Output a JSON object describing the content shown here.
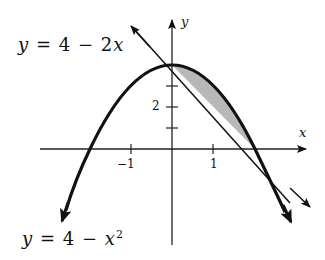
{
  "diagram": {
    "labels": {
      "line_eq": {
        "y": "y",
        "eq": "=",
        "a": "4",
        "op": "−",
        "b": "2",
        "var": "x"
      },
      "parabola_eq": {
        "y": "y",
        "eq": "=",
        "a": "4",
        "op": "−",
        "var": "x",
        "exp": "2"
      },
      "x_axis": "x",
      "y_axis": "y",
      "tick_neg1": "−1",
      "tick_1": "1",
      "tick_2": "2"
    },
    "curves": [
      {
        "name": "line",
        "equation": "y = 4 - 2x"
      },
      {
        "name": "parabola",
        "equation": "y = 4 - x^2"
      }
    ],
    "shaded_region": {
      "x_from": 0,
      "x_to": 2,
      "fill": "#b8b8b8"
    },
    "intersections": [
      [
        0,
        4
      ],
      [
        2,
        0
      ]
    ],
    "colors": {
      "stroke": "#111111",
      "shade": "#b8b8b8"
    }
  }
}
